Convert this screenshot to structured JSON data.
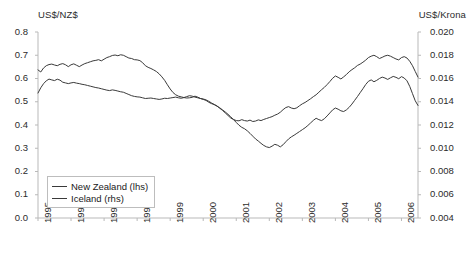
{
  "chart_data": {
    "type": "line",
    "title": "",
    "xlabel": "",
    "ylabel": "US$/NZ$",
    "y2label": "US$/Krona",
    "grid": false,
    "legend_position": "bottom-left",
    "x": [
      1995.0,
      1995.0833,
      1995.1667,
      1995.25,
      1995.3333,
      1995.4167,
      1995.5,
      1995.5833,
      1995.6667,
      1995.75,
      1995.8333,
      1995.9167,
      1996.0,
      1996.0833,
      1996.1667,
      1996.25,
      1996.3333,
      1996.4167,
      1996.5,
      1996.5833,
      1996.6667,
      1996.75,
      1996.8333,
      1996.9167,
      1997.0,
      1997.0833,
      1997.1667,
      1997.25,
      1997.3333,
      1997.4167,
      1997.5,
      1997.5833,
      1997.6667,
      1997.75,
      1997.8333,
      1997.9167,
      1998.0,
      1998.0833,
      1998.1667,
      1998.25,
      1998.3333,
      1998.4167,
      1998.5,
      1998.5833,
      1998.6667,
      1998.75,
      1998.8333,
      1998.9167,
      1999.0,
      1999.0833,
      1999.1667,
      1999.25,
      1999.3333,
      1999.4167,
      1999.5,
      1999.5833,
      1999.6667,
      1999.75,
      1999.8333,
      1999.9167,
      2000.0,
      2000.0833,
      2000.1667,
      2000.25,
      2000.3333,
      2000.4167,
      2000.5,
      2000.5833,
      2000.6667,
      2000.75,
      2000.8333,
      2000.9167,
      2001.0,
      2001.0833,
      2001.1667,
      2001.25,
      2001.3333,
      2001.4167,
      2001.5,
      2001.5833,
      2001.6667,
      2001.75,
      2001.8333,
      2001.9167,
      2002.0,
      2002.0833,
      2002.1667,
      2002.25,
      2002.3333,
      2002.4167,
      2002.5,
      2002.5833,
      2002.6667,
      2002.75,
      2002.8333,
      2002.9167,
      2003.0,
      2003.0833,
      2003.1667,
      2003.25,
      2003.3333,
      2003.4167,
      2003.5,
      2003.5833,
      2003.6667,
      2003.75,
      2003.8333,
      2003.9167,
      2004.0,
      2004.0833,
      2004.1667,
      2004.25,
      2004.3333,
      2004.4167,
      2004.5,
      2004.5833,
      2004.6667,
      2004.75,
      2004.8333,
      2004.9167,
      2005.0,
      2005.0833,
      2005.1667,
      2005.25,
      2005.3333,
      2005.4167,
      2005.5,
      2005.5833,
      2005.6667,
      2005.75,
      2005.8333,
      2005.9167,
      2006.0,
      2006.0833,
      2006.1667,
      2006.25,
      2006.3333,
      2006.4167,
      2006.5
    ],
    "series": [
      {
        "name": "New Zealand (lhs)",
        "axis": "left",
        "unit": "US$/NZ$",
        "color": "#3a3a3a",
        "values": [
          0.637,
          0.628,
          0.645,
          0.655,
          0.66,
          0.662,
          0.658,
          0.655,
          0.661,
          0.664,
          0.659,
          0.651,
          0.659,
          0.663,
          0.657,
          0.651,
          0.658,
          0.664,
          0.668,
          0.672,
          0.676,
          0.678,
          0.681,
          0.676,
          0.683,
          0.69,
          0.694,
          0.699,
          0.701,
          0.698,
          0.702,
          0.7,
          0.694,
          0.688,
          0.686,
          0.681,
          0.68,
          0.677,
          0.668,
          0.655,
          0.648,
          0.643,
          0.637,
          0.63,
          0.62,
          0.607,
          0.592,
          0.573,
          0.555,
          0.54,
          0.53,
          0.524,
          0.521,
          0.518,
          0.516,
          0.517,
          0.519,
          0.524,
          0.52,
          0.514,
          0.51,
          0.506,
          0.498,
          0.492,
          0.488,
          0.482,
          0.472,
          0.463,
          0.452,
          0.441,
          0.43,
          0.424,
          0.419,
          0.418,
          0.423,
          0.419,
          0.417,
          0.421,
          0.415,
          0.417,
          0.422,
          0.419,
          0.424,
          0.428,
          0.432,
          0.436,
          0.442,
          0.447,
          0.455,
          0.466,
          0.475,
          0.479,
          0.473,
          0.47,
          0.474,
          0.483,
          0.491,
          0.497,
          0.505,
          0.513,
          0.522,
          0.53,
          0.541,
          0.552,
          0.562,
          0.574,
          0.587,
          0.601,
          0.611,
          0.605,
          0.598,
          0.607,
          0.617,
          0.629,
          0.638,
          0.646,
          0.656,
          0.662,
          0.67,
          0.679,
          0.69,
          0.696,
          0.7,
          0.694,
          0.686,
          0.691,
          0.697,
          0.7,
          0.696,
          0.69,
          0.684,
          0.68,
          0.69,
          0.694,
          0.688,
          0.674,
          0.655,
          0.63,
          0.606
        ]
      },
      {
        "name": "Iceland (rhs)",
        "axis": "right",
        "unit": "US$/Krona",
        "color": "#3a3a3a",
        "values": [
          0.01475,
          0.0152,
          0.01555,
          0.0158,
          0.01595,
          0.01588,
          0.01582,
          0.01594,
          0.01586,
          0.01568,
          0.01562,
          0.01556,
          0.01562,
          0.01566,
          0.0156,
          0.01556,
          0.0155,
          0.01546,
          0.0154,
          0.01534,
          0.01528,
          0.01522,
          0.01518,
          0.01512,
          0.01506,
          0.015,
          0.01496,
          0.01502,
          0.01498,
          0.01492,
          0.01486,
          0.01482,
          0.01472,
          0.01462,
          0.01452,
          0.01446,
          0.01442,
          0.0144,
          0.01434,
          0.01428,
          0.0143,
          0.01432,
          0.01428,
          0.01424,
          0.0142,
          0.01424,
          0.0143,
          0.01428,
          0.01432,
          0.01436,
          0.0144,
          0.01434,
          0.0143,
          0.01436,
          0.01444,
          0.01452,
          0.01448,
          0.0144,
          0.01434,
          0.01428,
          0.01424,
          0.01416,
          0.01404,
          0.0139,
          0.01376,
          0.01362,
          0.01348,
          0.0133,
          0.01312,
          0.01292,
          0.0127,
          0.01246,
          0.01222,
          0.01198,
          0.0118,
          0.01168,
          0.0115,
          0.01128,
          0.01104,
          0.0108,
          0.01062,
          0.01042,
          0.01024,
          0.01012,
          0.01006,
          0.01018,
          0.01034,
          0.01026,
          0.01012,
          0.0103,
          0.01056,
          0.0108,
          0.01098,
          0.01112,
          0.01128,
          0.01144,
          0.0116,
          0.01176,
          0.01196,
          0.01218,
          0.0124,
          0.01258,
          0.01246,
          0.01238,
          0.01254,
          0.01278,
          0.01304,
          0.0133,
          0.01346,
          0.01336,
          0.01322,
          0.01316,
          0.0133,
          0.01352,
          0.0138,
          0.01412,
          0.01444,
          0.01478,
          0.01512,
          0.01548,
          0.01576,
          0.01588,
          0.01572,
          0.01584,
          0.016,
          0.01612,
          0.01604,
          0.01592,
          0.01606,
          0.01618,
          0.0161,
          0.01598,
          0.01616,
          0.01604,
          0.0158,
          0.01532,
          0.0147,
          0.01408,
          0.01368
        ]
      }
    ],
    "xaxis": {
      "ticks": [
        "1995",
        "1996",
        "1997",
        "1998",
        "1999",
        "2000",
        "2001",
        "2002",
        "2003",
        "2004",
        "2005",
        "2006"
      ],
      "min": 1995.0,
      "max": 2006.5
    },
    "yaxis_left": {
      "ticks": [
        "0.0",
        "0.1",
        "0.2",
        "0.3",
        "0.4",
        "0.5",
        "0.6",
        "0.7",
        "0.8"
      ],
      "min": 0.0,
      "max": 0.8
    },
    "yaxis_right": {
      "ticks": [
        "0.004",
        "0.006",
        "0.008",
        "0.010",
        "0.012",
        "0.014",
        "0.016",
        "0.018",
        "0.020"
      ],
      "min": 0.004,
      "max": 0.02
    }
  },
  "legend": {
    "items": [
      {
        "label": "New Zealand (lhs)"
      },
      {
        "label": "Iceland (rhs)"
      }
    ]
  },
  "caption": ""
}
